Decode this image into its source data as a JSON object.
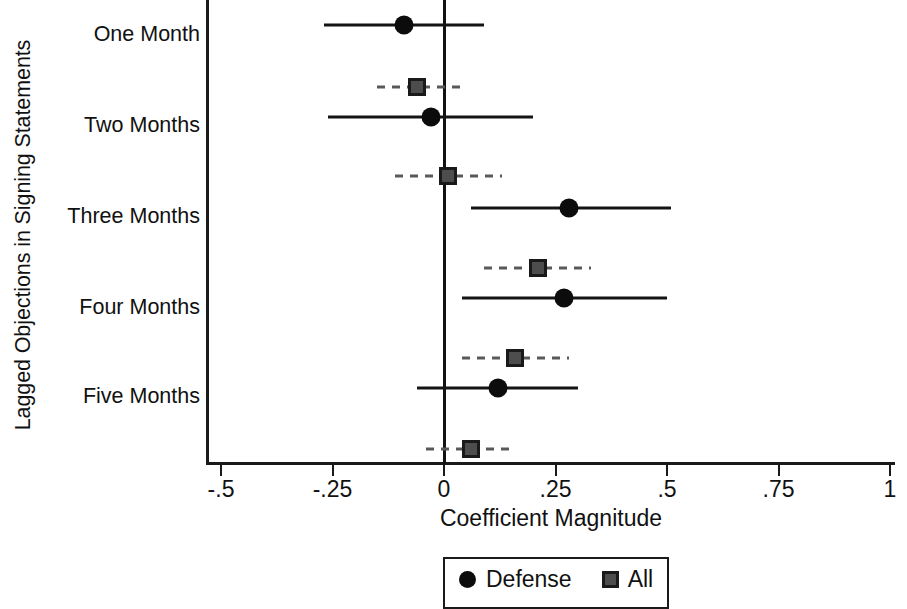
{
  "chart_data": {
    "type": "scatter",
    "subtype": "coefficient-forest-plot",
    "title": "",
    "xlabel": "Coefficient Magnitude",
    "ylabel": "Lagged Objections in Signing Statements",
    "orientation": "horizontal",
    "grid": false,
    "xlim": [
      -0.5,
      1.0
    ],
    "xticks": [
      -0.5,
      -0.25,
      0,
      0.25,
      0.5,
      0.75,
      1
    ],
    "xticklabels": [
      "-.5",
      "-.25",
      "0",
      ".25",
      ".5",
      ".75",
      "1"
    ],
    "reference_line": 0,
    "categories": [
      "One Month",
      "Two Months",
      "Three Months",
      "Four Months",
      "Five Months"
    ],
    "legend": {
      "position": "bottom-center",
      "entries": [
        {
          "label": "Defense",
          "marker": "circle",
          "color": "#0c0c0c",
          "linestyle": "solid"
        },
        {
          "label": "All",
          "marker": "square",
          "color": "#4d4d4d",
          "linestyle": "dashed"
        }
      ]
    },
    "series": [
      {
        "name": "Defense",
        "marker": "circle",
        "linestyle": "solid",
        "color": "#0c0c0c",
        "values": [
          -0.09,
          -0.03,
          0.28,
          0.27,
          0.12
        ],
        "ci_low": [
          -0.27,
          -0.26,
          0.06,
          0.04,
          -0.06
        ],
        "ci_high": [
          0.09,
          0.2,
          0.51,
          0.5,
          0.3
        ]
      },
      {
        "name": "All",
        "marker": "square",
        "linestyle": "dashed",
        "color": "#4d4d4d",
        "values": [
          -0.06,
          0.01,
          0.21,
          0.16,
          0.06
        ],
        "ci_low": [
          -0.15,
          -0.11,
          0.09,
          0.04,
          -0.04
        ],
        "ci_high": [
          0.04,
          0.13,
          0.33,
          0.28,
          0.16
        ]
      }
    ]
  },
  "axis": {
    "ylabel": "Lagged Objections in Signing Statements",
    "xlabel": "Coefficient Magnitude"
  },
  "legend": {
    "defense_label": "Defense",
    "all_label": "All"
  }
}
